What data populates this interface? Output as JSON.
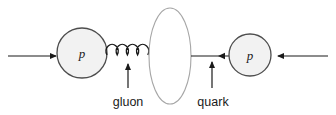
{
  "figure": {
    "kind": "particle-physics-collision-diagram",
    "width": 336,
    "height": 115,
    "background": "#ffffff"
  },
  "colors": {
    "blob_fill": "#f2f2f2",
    "blob_stroke": "#4d4d4d",
    "ellipse_fill": "#ffffff",
    "ellipse_stroke": "#a6a6a6",
    "line": "#1a1a1a",
    "gluon": "#1a1a1a",
    "text": "#1a1a1a"
  },
  "protons": {
    "left": {
      "label": "p",
      "cx": 82,
      "cy": 53,
      "r": 25
    },
    "right": {
      "label": "p",
      "cx": 250,
      "cy": 55,
      "r": 21
    }
  },
  "beams": {
    "left_arrow": {
      "name": "incoming-beam-left",
      "direction": "right",
      "x1": 8,
      "x2": 56,
      "y": 56
    },
    "right_arrow": {
      "name": "incoming-beam-right",
      "direction": "left",
      "x1": 328,
      "x2": 276,
      "y": 56
    }
  },
  "interaction_region": {
    "name": "collision-ellipse",
    "cx": 170,
    "cy": 56,
    "rx": 21,
    "ry": 48
  },
  "exchange": {
    "gluon": {
      "label": "gluon",
      "x_start": 107,
      "x_end": 148,
      "y": 55,
      "loops": 4,
      "loop_radius": 6
    },
    "quark": {
      "label": "quark",
      "direction": "left",
      "x1": 191,
      "x2": 229,
      "y": 56
    }
  },
  "callouts": [
    {
      "name": "gluon-callout",
      "label": "gluon",
      "label_x": 128,
      "label_y": 106,
      "arrow_x": 128,
      "arrow_y_bottom": 88,
      "arrow_y_top": 64
    },
    {
      "name": "quark-callout",
      "label": "quark",
      "label_x": 213,
      "label_y": 106,
      "arrow_x": 212,
      "arrow_y_bottom": 88,
      "arrow_y_top": 62
    }
  ]
}
